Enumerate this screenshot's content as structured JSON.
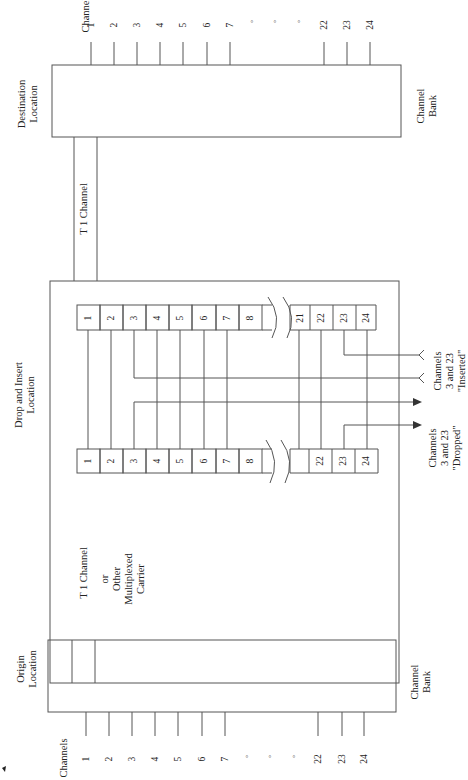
{
  "diagram": {
    "orientation": "rotated 90 degrees counter-clockwise",
    "destination": {
      "title_line1": "Destination",
      "title_line2": "Location",
      "bank_line1": "Channel",
      "bank_line2": "Bank",
      "channels_label": "Channels",
      "channel_ticks": [
        "1",
        "2",
        "3",
        "4",
        "5",
        "6",
        "7",
        "°",
        "°",
        "°",
        "22",
        "23",
        "24"
      ]
    },
    "t1_upper": {
      "label": "T 1 Channel"
    },
    "drop_insert": {
      "title_line1": "Drop and Insert",
      "title_line2": "Location",
      "insert_register": [
        "1",
        "2",
        "3",
        "4",
        "5",
        "6",
        "7",
        "8",
        "",
        "21",
        "22",
        "23",
        "24"
      ],
      "drop_register": [
        "1",
        "2",
        "3",
        "4",
        "5",
        "6",
        "7",
        "8",
        "",
        "",
        "22",
        "23",
        "24"
      ],
      "inserted_label": {
        "line1": "Channels",
        "line2": "3 and 23",
        "line3": "\"Inserted\""
      },
      "dropped_label": {
        "line1": "Channels",
        "line2": "3 and 23",
        "line3": "\"Dropped\""
      }
    },
    "t1_lower": {
      "label": "T 1 Channel",
      "alt_line1": "or",
      "alt_line2": "Other",
      "alt_line3": "Multiplexed",
      "alt_line4": "Carrier"
    },
    "origin": {
      "title_line1": "Origin",
      "title_line2": "Location",
      "bank_line1": "Channel",
      "bank_line2": "Bank",
      "channels_label": "Channels",
      "channel_ticks": [
        "1",
        "2",
        "3",
        "4",
        "5",
        "6",
        "7",
        "°",
        "°",
        "°",
        "22",
        "23",
        "24"
      ]
    },
    "colors": {
      "line": "#555555",
      "text": "#222222",
      "background": "#ffffff"
    }
  }
}
